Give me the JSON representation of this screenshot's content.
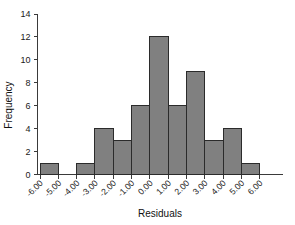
{
  "chart_data": {
    "type": "bar",
    "title": "",
    "xlabel": "Residuals",
    "ylabel": "Frequency",
    "categories": [
      "-6.00",
      "-5.00",
      "-4.00",
      "-3.00",
      "-2.00",
      "-1.00",
      "0.00",
      "1.00",
      "2.00",
      "3.00",
      "4.00",
      "5.00",
      "6.00"
    ],
    "bin_edges": [
      -6,
      -5,
      -4,
      -3,
      -2,
      -1,
      0,
      1,
      2,
      3,
      4,
      5,
      6
    ],
    "bin_labels": [
      "-6.00 to -5.00",
      "-5.00 to -4.00",
      "-4.00 to -3.00",
      "-3.00 to -2.00",
      "-2.00 to -1.00",
      "-1.00 to 0.00",
      "0.00 to 1.00",
      "1.00 to 2.00",
      "2.00 to 3.00",
      "3.00 to 4.00",
      "4.00 to 5.00",
      "5.00 to 6.00"
    ],
    "values": [
      1,
      0,
      1,
      4,
      3,
      6,
      12,
      6,
      9,
      3,
      4,
      1,
      1
    ],
    "bar_values": [
      1,
      0,
      1,
      4,
      3,
      6,
      12,
      6,
      9,
      3,
      4,
      1,
      1
    ],
    "ylim": [
      0,
      14
    ],
    "yticks": [
      0,
      2,
      4,
      6,
      8,
      10,
      12,
      14
    ],
    "ytick_labels": [
      "0",
      "2",
      "4",
      "6",
      "8",
      "10",
      "12",
      "14"
    ],
    "xtick_labels": [
      "-6.00",
      "-5.00",
      "-4.00",
      "-3.00",
      "-2.00",
      "-1.00",
      "0.00",
      "1.00",
      "2.00",
      "3.00",
      "4.00",
      "5.00",
      "6.00"
    ],
    "xtick_rotation": -45,
    "grid": false,
    "legend": false,
    "legend_position": "none",
    "bar_fill_color": "#808080",
    "bar_edge_color": "#2b2b2b",
    "axis_color": "#3a3a3a",
    "background_color": "#ffffff",
    "total_count": 48
  },
  "axes": {
    "y_title": "Frequency",
    "x_title": "Residuals"
  }
}
